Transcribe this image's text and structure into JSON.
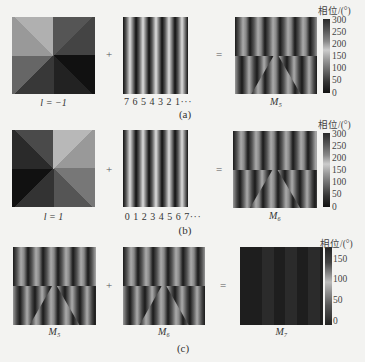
{
  "figure": {
    "rows": [
      {
        "id": "a",
        "caption": "(a)",
        "left_label": "l = −1",
        "plus": "+",
        "grating_label": "7 6 5 4 3 2 1···",
        "equals": "=",
        "result_label": "M₅",
        "colorbar": {
          "title": "相位/(°)",
          "ticks": [
            "300",
            "250",
            "200",
            "150",
            "100",
            "50",
            "0"
          ]
        }
      },
      {
        "id": "b",
        "caption": "(b)",
        "left_label": "l = 1",
        "plus": "+",
        "grating_label": "0 1 2 3 4 5 6 7···",
        "equals": "=",
        "result_label": "M₆",
        "colorbar": {
          "title": "相位/(°)",
          "ticks": [
            "300",
            "250",
            "200",
            "150",
            "100",
            "50",
            "0"
          ]
        }
      },
      {
        "id": "c",
        "caption": "(c)",
        "left_label": "M₅",
        "plus": "+",
        "middle_label": "M₆",
        "equals": "=",
        "result_label": "M₇",
        "colorbar": {
          "title": "相位/(°)",
          "ticks": [
            "150",
            "100",
            "50",
            "0"
          ]
        }
      }
    ]
  }
}
